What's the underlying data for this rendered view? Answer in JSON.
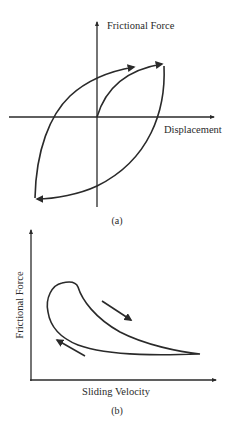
{
  "panel_a": {
    "y_axis_label": "Frictional Force",
    "x_axis_label": "Displacement",
    "caption": "(a)"
  },
  "panel_b": {
    "y_axis_label": "Frictional Force",
    "x_axis_label": "Sliding Velocity",
    "caption": "(b)"
  },
  "colors": {
    "stroke": "#2a2a2a",
    "background": "#ffffff"
  }
}
